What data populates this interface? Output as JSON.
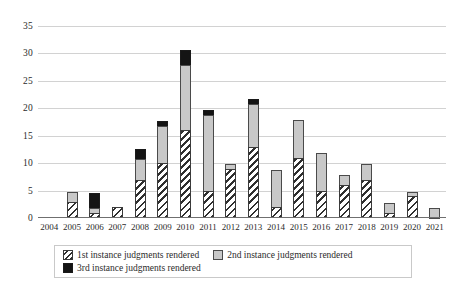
{
  "chart_data": {
    "type": "bar",
    "stacked": true,
    "title": "",
    "subtitle": "",
    "xlabel": "",
    "ylabel": "",
    "ylim": [
      0,
      35
    ],
    "yticks": [
      0,
      5,
      10,
      15,
      20,
      25,
      30,
      35
    ],
    "grid": true,
    "legend_position": "bottom",
    "categories": [
      "2004",
      "2005",
      "2006",
      "2007",
      "2008",
      "2009",
      "2010",
      "2011",
      "2012",
      "2013",
      "2014",
      "2015",
      "2016",
      "2017",
      "2018",
      "2019",
      "2020",
      "2021"
    ],
    "series": [
      {
        "name": "1st instance judgments rendered",
        "pattern": "diagonal-hatch",
        "color": "#ffffff",
        "values": [
          0,
          3,
          1,
          2,
          7,
          10,
          16,
          5,
          9,
          13,
          2,
          11,
          5,
          6,
          7,
          1,
          4,
          0
        ]
      },
      {
        "name": "2nd instance judgments rendered",
        "pattern": "solid",
        "color": "#c8c8c8",
        "values": [
          0,
          2,
          1,
          0,
          4,
          7,
          12,
          14,
          1,
          8,
          7,
          7,
          7,
          2,
          3,
          2,
          1,
          2
        ]
      },
      {
        "name": "3rd instance judgments rendered",
        "pattern": "solid",
        "color": "#141414",
        "values": [
          0,
          0,
          3,
          0,
          2,
          1,
          3,
          1,
          0,
          1,
          0,
          0,
          0,
          0,
          0,
          0,
          0,
          0
        ]
      }
    ],
    "totals": [
      0,
      5,
      5,
      2,
      13,
      18,
      31,
      20,
      10,
      22,
      9,
      18,
      12,
      8,
      10,
      3,
      5,
      2
    ]
  },
  "legend": {
    "items": [
      {
        "label": "1st instance judgments rendered",
        "swatch": "hatch-swatch"
      },
      {
        "label": "2nd instance judgments rendered",
        "swatch": "gray-swatch"
      },
      {
        "label": "3rd instance judgments rendered",
        "swatch": "black-swatch"
      }
    ]
  }
}
